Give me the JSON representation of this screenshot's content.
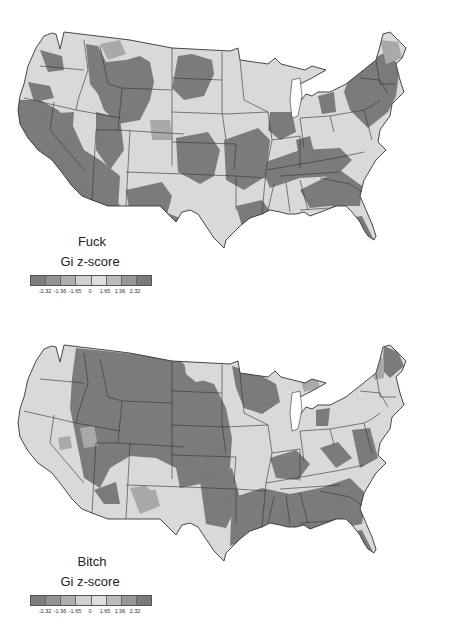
{
  "maps": [
    {
      "id": "top",
      "word": "Fuck",
      "legend_title": "Gi z-score",
      "tick_labels": [
        "-2.32",
        "-1.96",
        "-1.65",
        "0",
        "1.65",
        "1.96",
        "2.32"
      ],
      "swatch_colors": [
        "#7d7d7d",
        "#939393",
        "#aeaeae",
        "#d0d0d0",
        "#dedede",
        "#bcbcbc",
        "#979797",
        "#7a7a7a"
      ]
    },
    {
      "id": "bottom",
      "word": "Bitch",
      "legend_title": "Gi z-score",
      "tick_labels": [
        "-2.32",
        "-1.96",
        "-1.65",
        "0",
        "1.65",
        "1.96",
        "2.32"
      ],
      "swatch_colors": [
        "#7d7d7d",
        "#939393",
        "#aeaeae",
        "#d0d0d0",
        "#dedede",
        "#bcbcbc",
        "#979797",
        "#7a7a7a"
      ]
    }
  ],
  "colors": {
    "hotspot": "#7b7b7b",
    "neutral": "#d9d9d9",
    "mid": "#a9a9a9",
    "border": "#333333",
    "water": "#ffffff"
  }
}
